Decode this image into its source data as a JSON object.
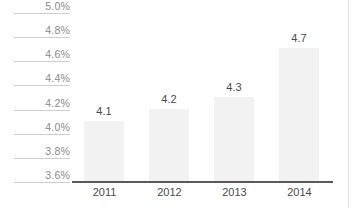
{
  "chart_data": {
    "type": "bar",
    "title": "",
    "subtitle": "",
    "xlabel": "",
    "ylabel": "",
    "categories": [
      "2011",
      "2012",
      "2013",
      "2014"
    ],
    "values": [
      4.1,
      4.2,
      4.3,
      4.7
    ],
    "value_labels": [
      "4.1",
      "4.2",
      "4.3",
      "4.7"
    ],
    "ylim": [
      3.6,
      5.0
    ],
    "ytick_values": [
      3.6,
      3.8,
      4.0,
      4.2,
      4.4,
      4.6,
      4.8,
      5.0
    ],
    "ytick_labels": [
      "3.6%",
      "3.8%",
      "4.0%",
      "4.2%",
      "4.4%",
      "4.6%",
      "4.8%",
      "5.0%"
    ],
    "grid": false,
    "legend": "none",
    "series": [
      {
        "name": "",
        "values": [
          4.1,
          4.2,
          4.3,
          4.7
        ]
      }
    ],
    "colors": {
      "bar_fill": "#f2f2f2",
      "axis_line": "#595959",
      "tick_rule": "#cfcfcf",
      "tick_label": "#8a8a8a",
      "value_label": "#4a4a4a",
      "category_label": "#4a4a4a",
      "background": "#ffffff",
      "edge_rule": "#e2e2e2"
    }
  }
}
